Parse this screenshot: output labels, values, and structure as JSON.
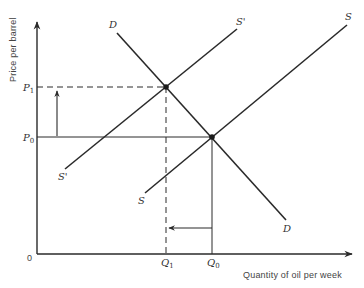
{
  "diagram": {
    "type": "supply-demand",
    "axes": {
      "y_label": "Price per barrel",
      "x_label": "Quantity of oil per week",
      "origin_label": "0"
    },
    "price_labels": {
      "p1": {
        "letter": "P",
        "sub": "1"
      },
      "p0": {
        "letter": "P",
        "sub": "0"
      }
    },
    "quantity_labels": {
      "q1": {
        "letter": "Q",
        "sub": "1"
      },
      "q0": {
        "letter": "Q",
        "sub": "0"
      }
    },
    "curves": {
      "demand": {
        "label_top": "D",
        "label_bottom": "D"
      },
      "supply_original": {
        "label_top": "S",
        "label_bottom": "S"
      },
      "supply_shifted": {
        "label_top": "S'",
        "label_bottom": "S'"
      }
    },
    "equilibria": [
      {
        "name": "E1",
        "price": "P1",
        "quantity": "Q1"
      },
      {
        "name": "E0",
        "price": "P0",
        "quantity": "Q0"
      }
    ],
    "arrows": [
      {
        "name": "price-increase-arrow",
        "direction": "up",
        "from": "P0",
        "to": "P1"
      },
      {
        "name": "quantity-decrease-arrow",
        "direction": "left",
        "from": "Q0",
        "to": "Q1"
      }
    ],
    "colors": {
      "line": "#2a2a2a",
      "text": "#333333"
    }
  }
}
